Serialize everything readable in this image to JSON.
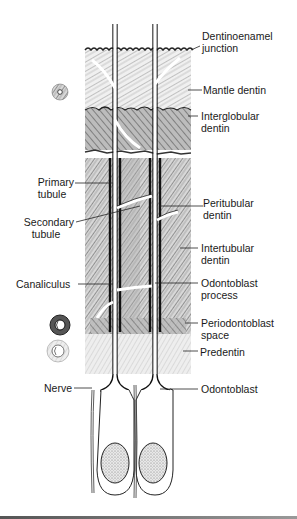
{
  "figure": {
    "labels_right": [
      {
        "id": "dentinoenamel-junction",
        "line1": "Dentinoenamel",
        "line2": "junction"
      },
      {
        "id": "mantle-dentin",
        "line1": "Mantle dentin",
        "line2": ""
      },
      {
        "id": "interglobular-dentin",
        "line1": "Interglobular",
        "line2": "dentin"
      },
      {
        "id": "peritubular-dentin",
        "line1": "Peritubular",
        "line2": "dentin"
      },
      {
        "id": "intertubular-dentin",
        "line1": "Intertubular",
        "line2": "dentin"
      },
      {
        "id": "odontoblast-process",
        "line1": "Odontoblast",
        "line2": "process"
      },
      {
        "id": "periodontoblast-space",
        "line1": "Periodontoblast",
        "line2": "space"
      },
      {
        "id": "predentin",
        "line1": "Predentin",
        "line2": ""
      },
      {
        "id": "odontoblast",
        "line1": "Odontoblast",
        "line2": ""
      }
    ],
    "labels_left": [
      {
        "id": "primary-tubule",
        "line1": "Primary",
        "line2": "tubule"
      },
      {
        "id": "secondary-tubule",
        "line1": "Secondary",
        "line2": "tubule"
      },
      {
        "id": "canaliculus",
        "line1": "Canaliculus",
        "line2": ""
      },
      {
        "id": "nerve",
        "line1": "Nerve",
        "line2": ""
      }
    ],
    "colors": {
      "ink": "#1a1a1a",
      "dentin_texture": "#8a8a8a",
      "dark_band": "#3a3a3a",
      "predentin": "#c8c8c8",
      "nucleus_fill": "#d0d0d0"
    }
  }
}
